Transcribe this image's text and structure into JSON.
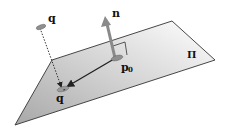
{
  "diagram": {
    "labels": {
      "point_q": "q",
      "normal_n": "n",
      "point_p0_main": "p",
      "point_p0_sub": "0",
      "projection_q_prime": "q",
      "prime_mark": "′",
      "plane_pi": "Π"
    },
    "colors": {
      "plane_light": "#ffffff",
      "plane_dark": "#a9a9a9",
      "edge": "#333333",
      "normal_arrow": "#8a8a8a",
      "point_fill": "#8f8f8f"
    }
  }
}
